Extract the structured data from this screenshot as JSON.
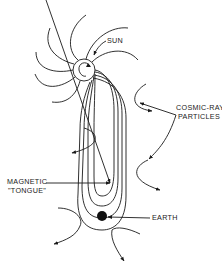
{
  "diagram": {
    "labels": {
      "sun": "SUN",
      "cosmic_ray_line1": "COSMIC-RAY",
      "cosmic_ray_line2": "PARTICLES",
      "magnetic_line1": "MAGNETIC",
      "magnetic_line2": "\"TONGUE\"",
      "earth": "EARTH"
    },
    "colors": {
      "ink": "#1a1a1a",
      "background": "#ffffff"
    },
    "elements": {
      "sun": {
        "cx": 84,
        "cy": 70,
        "r": 11
      },
      "earth": {
        "cx": 102,
        "cy": 216,
        "r": 5
      }
    }
  }
}
